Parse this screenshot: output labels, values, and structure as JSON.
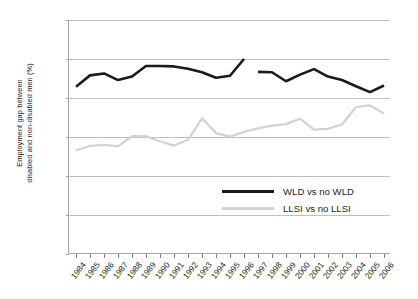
{
  "chart_data": {
    "type": "line",
    "title": "",
    "xlabel": "",
    "ylabel": "Employment gap between disabled and non-disabled men (%)",
    "ylabel_line1": "Employment gap between",
    "ylabel_line2": "disabled and non-disabled men (%)",
    "ylim": [
      0,
      60
    ],
    "yticks": [
      0,
      10,
      20,
      30,
      40,
      50,
      60
    ],
    "ytick_labels": [
      "0",
      "10",
      "20",
      "30",
      "40",
      "50",
      "60"
    ],
    "grid": true,
    "legend_position": "inside-bottom-right",
    "categories": [
      "1984",
      "1985",
      "1986",
      "1987",
      "1988",
      "1989",
      "1990",
      "1991",
      "1992",
      "1993",
      "1994",
      "1995",
      "1996",
      "1997",
      "1998",
      "1999",
      "2000",
      "2001",
      "2002",
      "2003",
      "2004",
      "2005",
      "2006"
    ],
    "series": [
      {
        "name": "WLD vs no WLD",
        "color": "#1a1a1a",
        "break_after": "1996",
        "values": [
          42.9,
          45.8,
          46.3,
          44.6,
          45.5,
          48.2,
          48.2,
          48.1,
          47.5,
          46.6,
          45.2,
          45.7,
          50.0,
          46.7,
          46.6,
          44.3,
          46.0,
          47.4,
          45.5,
          44.6,
          43.0,
          41.5,
          43.2
        ]
      },
      {
        "name": "LLSI vs no LLSI",
        "color": "#d2d2d2",
        "values": [
          26.6,
          27.7,
          28.0,
          27.6,
          30.2,
          30.2,
          28.9,
          27.8,
          29.3,
          34.8,
          31.0,
          30.1,
          31.3,
          32.2,
          32.9,
          33.3,
          34.7,
          31.9,
          32.1,
          33.2,
          37.7,
          38.1,
          36.0
        ]
      }
    ]
  },
  "legend": {
    "items": [
      {
        "label": "WLD vs no WLD"
      },
      {
        "label": "LLSI vs no LLSI"
      }
    ]
  }
}
